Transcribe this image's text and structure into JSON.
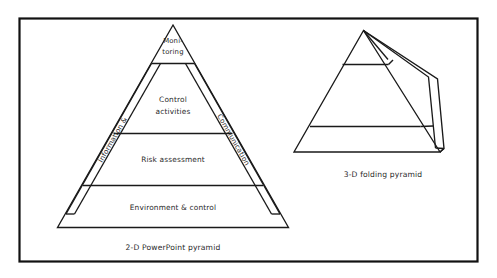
{
  "figure": {
    "background_color": "#ffffff",
    "line_color": "#1a1a1a",
    "frame_color": "#111111",
    "text_color": "#2a2a2a"
  },
  "pyramid_2d": {
    "caption": "2-D PowerPoint pyramid",
    "levels": [
      {
        "id": "monitoring",
        "line1": "Moni-",
        "line2": "toring"
      },
      {
        "id": "control-activities",
        "line1": "Control",
        "line2": "activities"
      },
      {
        "id": "risk-assessment",
        "line1": "Risk assessment",
        "line2": ""
      },
      {
        "id": "environment-control",
        "line1": "Environment & control",
        "line2": ""
      }
    ],
    "side_labels": [
      {
        "id": "information",
        "text": "Information &",
        "side": "left"
      },
      {
        "id": "communication",
        "text": "Communication",
        "side": "right"
      }
    ]
  },
  "pyramid_3d": {
    "caption": "3-D folding pyramid"
  }
}
